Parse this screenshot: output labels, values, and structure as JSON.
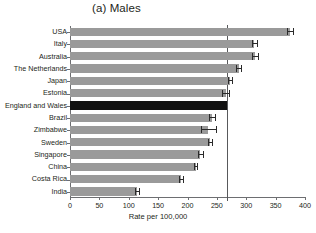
{
  "chart_data": {
    "type": "bar",
    "orientation": "horizontal",
    "title": "(a) Males",
    "xlabel": "Rate per 100,000",
    "ylabel": "",
    "xlim": [
      0,
      400
    ],
    "xticks": [
      0,
      50,
      100,
      150,
      200,
      250,
      300,
      350,
      400
    ],
    "xtick_labels": [
      "0",
      "50",
      "100",
      "150",
      "200",
      "250",
      "300",
      "350",
      "400"
    ],
    "grid": false,
    "legend": "none",
    "categories": [
      "USA",
      "Italy",
      "Australia",
      "The Netherlands",
      "Japan",
      "Estonia",
      "England and Wales",
      "Brazil",
      "Zimbabwe",
      "Sweden",
      "Singapore",
      "China",
      "Costa Rica",
      "India"
    ],
    "values": [
      374,
      314,
      315,
      287,
      272,
      265,
      268,
      242,
      235,
      238,
      222,
      214,
      189,
      114
    ],
    "error_low": [
      370,
      310,
      310,
      283,
      269,
      259,
      268,
      237,
      223,
      235,
      218,
      211,
      185,
      111
    ],
    "error_high": [
      379,
      319,
      320,
      291,
      275,
      271,
      268,
      247,
      248,
      241,
      226,
      217,
      193,
      118
    ],
    "reference_line": 268,
    "highlight_category": "England and Wales",
    "colors": {
      "bar": "#9a9a9a",
      "highlight_bar": "#111111",
      "error_bar": "#2b2b2b",
      "reference_line": "#58595b",
      "axis": "#6d6e71",
      "text": "#231f20",
      "background": "#ffffff"
    }
  }
}
